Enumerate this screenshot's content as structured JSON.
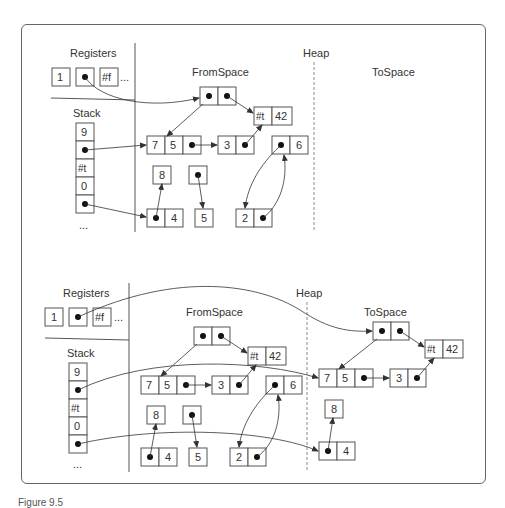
{
  "caption": "Figure 9.5",
  "panels": [
    {
      "name": "before-collection",
      "labels": {
        "registers": "Registers",
        "stack": "Stack",
        "heap": "Heap",
        "from_space": "FromSpace",
        "to_space": "ToSpace"
      },
      "registers": [
        "1",
        "•",
        "#f",
        "..."
      ],
      "stack": [
        "9",
        "•",
        "#t",
        "0",
        "•",
        "..."
      ],
      "from_space_objects": [
        {
          "id": "pair-root",
          "cells": [
            "•",
            "•"
          ]
        },
        {
          "id": "tuple-t42",
          "cells": [
            "#t",
            "42"
          ]
        },
        {
          "id": "tuple-75",
          "cells": [
            "7",
            "5",
            "•"
          ]
        },
        {
          "id": "tuple-3",
          "cells": [
            "3",
            "•"
          ]
        },
        {
          "id": "tuple-6",
          "cells": [
            "•",
            "6"
          ]
        },
        {
          "id": "tuple-8",
          "cells": [
            "8"
          ]
        },
        {
          "id": "tuple-ptr5",
          "cells": [
            "•"
          ]
        },
        {
          "id": "tuple-4",
          "cells": [
            "•",
            "4"
          ]
        },
        {
          "id": "tuple-5",
          "cells": [
            "5"
          ]
        },
        {
          "id": "tuple-2",
          "cells": [
            "2",
            "•"
          ]
        }
      ],
      "to_space_objects": []
    },
    {
      "name": "after-collection",
      "labels": {
        "registers": "Registers",
        "stack": "Stack",
        "heap": "Heap",
        "from_space": "FromSpace",
        "to_space": "ToSpace"
      },
      "registers": [
        "1",
        "•",
        "#f",
        "..."
      ],
      "stack": [
        "9",
        "•",
        "#t",
        "0",
        "•",
        "..."
      ],
      "from_space_objects": [
        {
          "id": "pair-root",
          "cells": [
            "•",
            "•"
          ]
        },
        {
          "id": "tuple-t42",
          "cells": [
            "#t",
            "42"
          ]
        },
        {
          "id": "tuple-75",
          "cells": [
            "7",
            "5",
            "•"
          ]
        },
        {
          "id": "tuple-3",
          "cells": [
            "3",
            "•"
          ]
        },
        {
          "id": "tuple-6",
          "cells": [
            "•",
            "6"
          ]
        },
        {
          "id": "tuple-8",
          "cells": [
            "8"
          ]
        },
        {
          "id": "tuple-ptr5",
          "cells": [
            "•"
          ]
        },
        {
          "id": "tuple-4",
          "cells": [
            "•",
            "4"
          ]
        },
        {
          "id": "tuple-5",
          "cells": [
            "5"
          ]
        },
        {
          "id": "tuple-2",
          "cells": [
            "2",
            "•"
          ]
        }
      ],
      "to_space_objects": [
        {
          "id": "pair-root",
          "cells": [
            "•",
            "•"
          ]
        },
        {
          "id": "tuple-t42",
          "cells": [
            "#t",
            "42"
          ]
        },
        {
          "id": "tuple-75",
          "cells": [
            "7",
            "5",
            "•"
          ]
        },
        {
          "id": "tuple-3",
          "cells": [
            "3",
            "•"
          ]
        },
        {
          "id": "tuple-8",
          "cells": [
            "8"
          ]
        },
        {
          "id": "tuple-4",
          "cells": [
            "•",
            "4"
          ]
        }
      ]
    }
  ]
}
